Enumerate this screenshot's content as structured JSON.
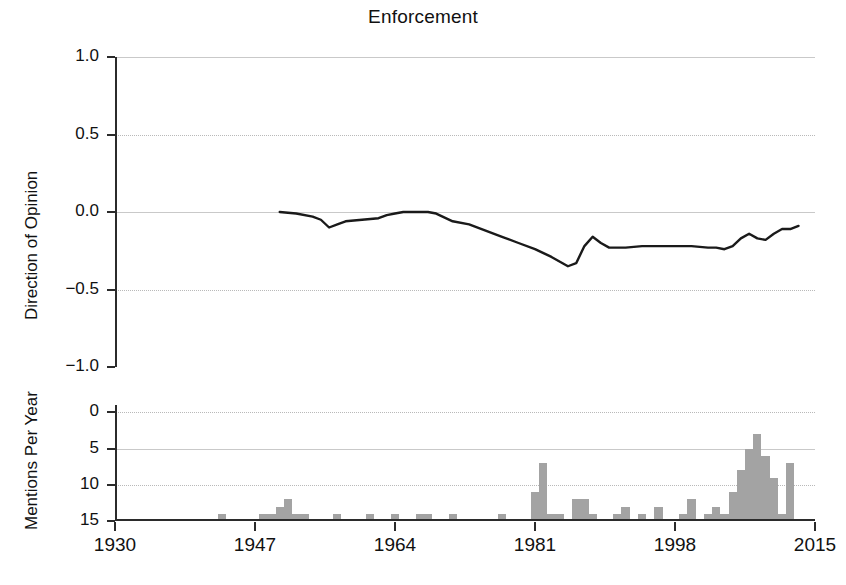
{
  "title": "Enforcement",
  "panels": {
    "top": {
      "ylabel": "Direction of Opinion",
      "yticks": [
        "1.0",
        "0.5",
        "0.0",
        "−0.5",
        "−1.0"
      ]
    },
    "bottom": {
      "ylabel": "Mentions Per Year",
      "yticks": [
        "15",
        "10",
        "5",
        "0"
      ]
    }
  },
  "xticks": [
    "1930",
    "1947",
    "1964",
    "1981",
    "1998",
    "2015"
  ],
  "colors": {
    "bar_fill": "#a3a3a3",
    "line_stroke": "#1a1a1a",
    "axis": "#2b2b2b",
    "grid": "#c9c9c9"
  },
  "chart_data": [
    {
      "type": "line",
      "title": "Enforcement",
      "xlabel": "",
      "ylabel": "Direction of Opinion",
      "xlim": [
        1930,
        2015
      ],
      "ylim": [
        -1.0,
        1.0
      ],
      "ytick_values": [
        1.0,
        0.5,
        0.0,
        -0.5,
        -1.0
      ],
      "xtick_values": [
        1930,
        1947,
        1964,
        1981,
        1998,
        2015
      ],
      "grid": true,
      "legend": "none",
      "series": [
        {
          "name": "Direction of Opinion",
          "x": [
            1950,
            1952,
            1954,
            1955,
            1956,
            1957,
            1958,
            1960,
            1962,
            1963,
            1964,
            1965,
            1966,
            1967,
            1968,
            1969,
            1971,
            1973,
            1975,
            1977,
            1979,
            1981,
            1983,
            1985,
            1986,
            1987,
            1988,
            1989,
            1990,
            1992,
            1994,
            1996,
            1998,
            2000,
            2002,
            2003,
            2004,
            2005,
            2006,
            2007,
            2008,
            2009,
            2010,
            2011,
            2012,
            2013
          ],
          "y": [
            0.0,
            -0.01,
            -0.03,
            -0.05,
            -0.1,
            -0.08,
            -0.06,
            -0.05,
            -0.04,
            -0.02,
            -0.01,
            0.0,
            0.0,
            0.0,
            0.0,
            -0.01,
            -0.06,
            -0.08,
            -0.12,
            -0.16,
            -0.2,
            -0.24,
            -0.29,
            -0.35,
            -0.33,
            -0.22,
            -0.16,
            -0.2,
            -0.23,
            -0.23,
            -0.22,
            -0.22,
            -0.22,
            -0.22,
            -0.23,
            -0.23,
            -0.24,
            -0.22,
            -0.17,
            -0.14,
            -0.17,
            -0.18,
            -0.14,
            -0.11,
            -0.11,
            -0.09
          ]
        }
      ]
    },
    {
      "type": "bar",
      "title": "",
      "xlabel": "",
      "ylabel": "Mentions Per Year",
      "xlim": [
        1930,
        2015
      ],
      "ylim": [
        0,
        16
      ],
      "ytick_values": [
        0,
        5,
        10,
        15
      ],
      "xtick_values": [
        1930,
        1947,
        1964,
        1981,
        1998,
        2015
      ],
      "grid": true,
      "legend": "none",
      "categories": [
        1943,
        1948,
        1949,
        1950,
        1951,
        1952,
        1953,
        1957,
        1961,
        1964,
        1967,
        1968,
        1971,
        1977,
        1981,
        1982,
        1983,
        1984,
        1986,
        1987,
        1988,
        1991,
        1992,
        1994,
        1996,
        1999,
        2000,
        2002,
        2003,
        2004,
        2005,
        2006,
        2007,
        2008,
        2009,
        2010,
        2011,
        2012
      ],
      "values": [
        1,
        1,
        1,
        2,
        3,
        1,
        1,
        1,
        1,
        1,
        1,
        1,
        1,
        1,
        4,
        8,
        1,
        1,
        3,
        3,
        1,
        1,
        2,
        1,
        2,
        1,
        3,
        1,
        2,
        1,
        4,
        7,
        10,
        12,
        9,
        6,
        1,
        8
      ]
    }
  ]
}
